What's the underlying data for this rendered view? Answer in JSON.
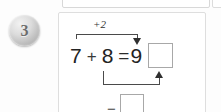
{
  "exercise": {
    "number": "3",
    "badge_color": "#9a9a9a"
  },
  "equation": {
    "left_addend": "7",
    "plus_1": "+",
    "right_addend": "8",
    "equals": "=",
    "result_first": "9",
    "plus_2": "+",
    "answer_box_top_value": "",
    "answer_box_bottom_value": ""
  },
  "annotations": {
    "top_label": "+2",
    "top_arrow_direction": "down-arrow-icon",
    "bottom_operator": "−",
    "bottom_arrow_direction": "up-arrow-icon"
  },
  "colors": {
    "ink": "#232323",
    "rule": "#4a4a4a",
    "box_border": "#a8a8a8",
    "card_border": "#dedede",
    "page_background": "#fdfdfd"
  }
}
